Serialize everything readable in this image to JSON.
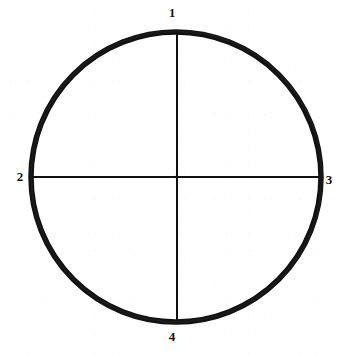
{
  "figure": {
    "name": "quadrant-circle-diagram",
    "background_color": "#ffffff",
    "ink_color": "#111111",
    "width": 344,
    "height": 356
  },
  "diagram": {
    "shape": "circle",
    "center": {
      "x": 176,
      "y": 177
    },
    "radius": 145,
    "circle_stroke_width": 5.5,
    "axis_stroke_width": 2,
    "axes": [
      {
        "name": "vertical-diameter",
        "from": {
          "x": 177,
          "y": 32
        },
        "to": {
          "x": 177,
          "y": 320
        }
      },
      {
        "name": "horizontal-diameter",
        "from": {
          "x": 31,
          "y": 177
        },
        "to": {
          "x": 319,
          "y": 177
        }
      }
    ]
  },
  "labels": {
    "top": "1",
    "left": "2",
    "right": "3",
    "bottom": "4"
  },
  "chart_data": {
    "type": "diagram",
    "title": "",
    "subtitle": "",
    "xlabel": "",
    "ylabel": "",
    "categories": [
      "1",
      "2",
      "3",
      "4"
    ],
    "points": [
      {
        "label": "1",
        "position": "top",
        "x": 176,
        "y": 32,
        "angle_deg": 90
      },
      {
        "label": "2",
        "position": "left",
        "x": 31,
        "y": 177,
        "angle_deg": 180
      },
      {
        "label": "3",
        "position": "right",
        "x": 319,
        "y": 177,
        "angle_deg": 0
      },
      {
        "label": "4",
        "position": "bottom",
        "x": 176,
        "y": 320,
        "angle_deg": 270
      }
    ],
    "grid": false,
    "legend": "none"
  }
}
